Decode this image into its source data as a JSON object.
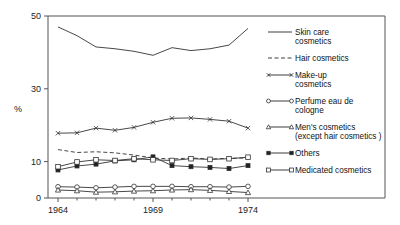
{
  "chart_data": {
    "type": "line",
    "title": "",
    "xlabel": "",
    "ylabel": "%",
    "xlim": [
      1964,
      1974
    ],
    "ylim": [
      0,
      50
    ],
    "ytick_labels": [
      "0",
      "10",
      "30",
      "50"
    ],
    "yticks": [
      0,
      10,
      30,
      50
    ],
    "xtick_labels": [
      "1964",
      "1969",
      "1974"
    ],
    "xticks": [
      1964,
      1969,
      1974
    ],
    "grid": false,
    "legend_position": "right",
    "x": [
      1964,
      1965,
      1966,
      1967,
      1968,
      1969,
      1970,
      1971,
      1972,
      1973,
      1974
    ],
    "series": [
      {
        "name": "Skin care cosmetics",
        "marker": "none",
        "dash": "solid",
        "values": [
          47.0,
          44.6,
          41.5,
          41.0,
          40.3,
          39.2,
          41.3,
          40.5,
          41.0,
          42.0,
          46.6
        ]
      },
      {
        "name": "Hair cosmetics",
        "marker": "none",
        "dash": "dashed",
        "values": [
          13.3,
          12.5,
          12.7,
          12.4,
          11.8,
          11.0,
          10.7,
          11.0,
          10.7,
          10.9,
          11.0
        ]
      },
      {
        "name": "Make-up cosmetics",
        "marker": "cross",
        "dash": "solid",
        "values": [
          17.8,
          17.9,
          19.2,
          18.6,
          19.4,
          20.8,
          21.9,
          22.0,
          21.6,
          21.1,
          19.2
        ]
      },
      {
        "name": "Perfume eau de cologne",
        "marker": "circle",
        "dash": "solid",
        "values": [
          3.1,
          3.0,
          2.8,
          3.0,
          3.2,
          3.2,
          3.2,
          3.1,
          3.1,
          3.0,
          3.2
        ]
      },
      {
        "name": "Men's cosmetics (except hair cosmetics)",
        "marker": "triangle",
        "dash": "solid",
        "values": [
          2.2,
          2.0,
          1.6,
          1.7,
          1.9,
          2.0,
          2.2,
          2.3,
          2.1,
          1.8,
          1.5
        ]
      },
      {
        "name": "Others",
        "marker": "square-filled",
        "dash": "solid",
        "values": [
          7.7,
          8.8,
          9.3,
          10.2,
          10.5,
          11.3,
          8.9,
          8.6,
          8.4,
          8.1,
          8.9
        ]
      },
      {
        "name": "Medicated cosmetics",
        "marker": "square-open",
        "dash": "solid",
        "values": [
          8.6,
          9.9,
          10.5,
          10.3,
          10.8,
          10.5,
          10.3,
          10.8,
          10.6,
          10.8,
          11.2
        ]
      }
    ]
  },
  "axes": {
    "ylabel": "%",
    "ytick_0": "0",
    "ytick_10": "10",
    "ytick_30": "30",
    "ytick_50": "50",
    "xtick_1964": "1964",
    "xtick_1969": "1969",
    "xtick_1974": "1974"
  },
  "legend": {
    "entries": [
      {
        "label_line1": "Skin care",
        "label_line2": "cosmetics",
        "marker": "none",
        "dash": "solid"
      },
      {
        "label_line1": "Hair cosmetics",
        "label_line2": "",
        "marker": "none",
        "dash": "dashed"
      },
      {
        "label_line1": "Make-up",
        "label_line2": "cosmetics",
        "marker": "cross",
        "dash": "solid"
      },
      {
        "label_line1": "Perfume eau de",
        "label_line2": "cologne",
        "marker": "circle",
        "dash": "solid"
      },
      {
        "label_line1": "Men's cosmetics",
        "label_line2": "(except hair cosmetics )",
        "marker": "triangle",
        "dash": "solid"
      },
      {
        "label_line1": "Others",
        "label_line2": "",
        "marker": "square-filled",
        "dash": "solid"
      },
      {
        "label_line1": "Medicated cosmetics",
        "label_line2": "",
        "marker": "square-open",
        "dash": "solid"
      }
    ]
  },
  "colors": {
    "ink": "#333333",
    "background": "#ffffff"
  }
}
